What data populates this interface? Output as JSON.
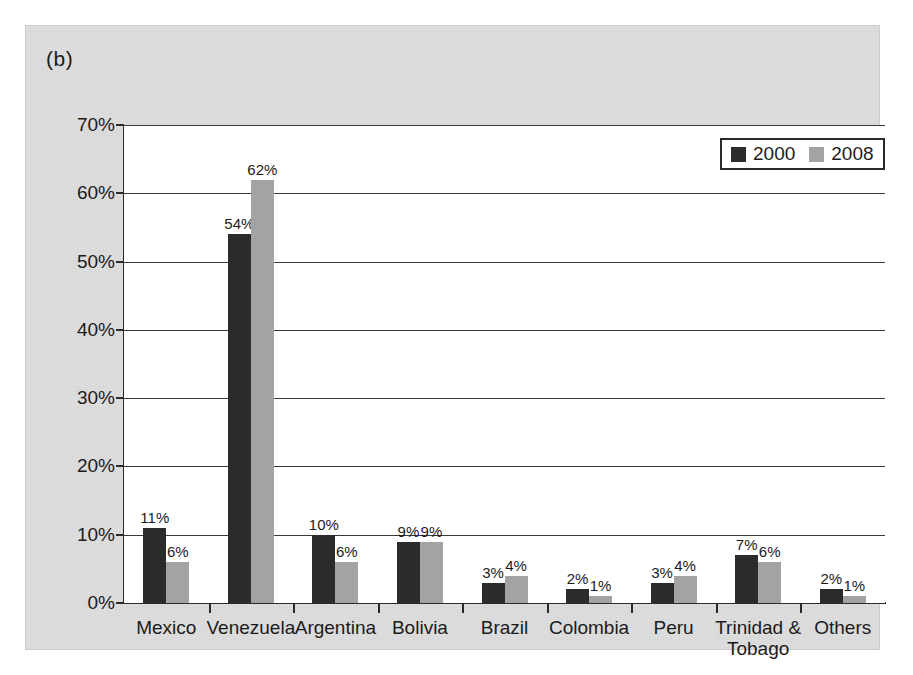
{
  "panel": {
    "label": "(b)"
  },
  "legend": {
    "items": [
      {
        "name": "2000",
        "color": "#2b2b2b"
      },
      {
        "name": "2008",
        "color": "#a3a3a3"
      }
    ]
  },
  "axis": {
    "y_ticks": [
      "70%",
      "60%",
      "50%",
      "40%",
      "30%",
      "20%",
      "10%",
      "0%"
    ]
  },
  "chart_data": {
    "type": "bar",
    "title": "(b)",
    "xlabel": "",
    "ylabel": "",
    "ylim": [
      0,
      70
    ],
    "ytick_values": [
      0,
      10,
      20,
      30,
      40,
      50,
      60,
      70
    ],
    "ytick_labels": [
      "0%",
      "10%",
      "20%",
      "30%",
      "40%",
      "50%",
      "60%",
      "70%"
    ],
    "grid": true,
    "legend_position": "top-right",
    "value_format": "percent",
    "categories": [
      "Mexico",
      "Venezuela",
      "Argentina",
      "Bolivia",
      "Brazil",
      "Colombia",
      "Peru",
      "Trinidad &\nTobago",
      "Others"
    ],
    "series": [
      {
        "name": "2000",
        "color": "#2b2b2b",
        "values": [
          11,
          54,
          10,
          9,
          3,
          2,
          3,
          7,
          2
        ],
        "labels": [
          "11%",
          "54%",
          "10%",
          "9%",
          "3%",
          "2%",
          "3%",
          "7%",
          "2%"
        ]
      },
      {
        "name": "2008",
        "color": "#a3a3a3",
        "values": [
          6,
          62,
          6,
          9,
          4,
          1,
          4,
          6,
          1
        ],
        "labels": [
          "6%",
          "62%",
          "6%",
          "9%",
          "4%",
          "1%",
          "4%",
          "6%",
          "1%"
        ]
      }
    ]
  }
}
